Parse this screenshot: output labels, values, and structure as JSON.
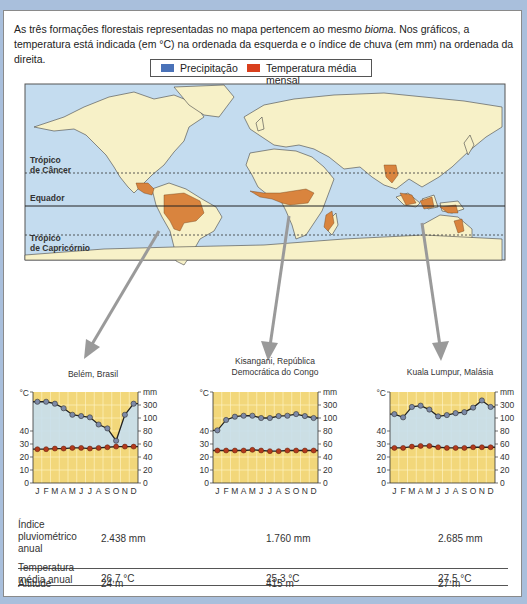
{
  "intro": {
    "part1": "As três formações florestais representadas no mapa pertencem ao mesmo ",
    "italic": "bioma",
    "part2": ". Nos gráficos, a temperatura está indicada (em °C) na ordenada da esquerda e o índice de chuva (em mm) na ordenada da direita."
  },
  "legend": {
    "precip_label": "Precipitação",
    "precip_color": "#4a72b8",
    "temp_label": "Temperatura média mensal",
    "temp_color": "#d9401e"
  },
  "map": {
    "labels": {
      "cancer_line1": "Trópico",
      "cancer_line2": "de Câncer",
      "equator": "Equador",
      "capricorn_line1": "Trópico",
      "capricorn_line2": "de Capricórnio"
    },
    "colors": {
      "ocean": "#c4dcef",
      "land": "#f7f1c8",
      "forest": "#d9843e"
    }
  },
  "chart_data": [
    {
      "type": "line",
      "title": "Belém, Brasil",
      "categories": [
        "J",
        "F",
        "M",
        "A",
        "M",
        "J",
        "J",
        "A",
        "S",
        "O",
        "N",
        "D"
      ],
      "xlabel": "mês",
      "ylabel_left": "°C",
      "ylabel_right": "mm",
      "left_ticks": [
        "0",
        "10",
        "20",
        "30",
        "40"
      ],
      "right_ticks": [
        "0",
        "20",
        "40",
        "60",
        "80",
        "100",
        "300"
      ],
      "series": [
        {
          "name": "Precipitação",
          "unit": "mm",
          "values": [
            350,
            350,
            320,
            250,
            150,
            130,
            110,
            90,
            84,
            65,
            150,
            320
          ]
        },
        {
          "name": "Temperatura média mensal",
          "unit": "°C",
          "values": [
            26,
            26,
            26.5,
            26.5,
            27,
            27,
            26.5,
            27,
            27.5,
            28,
            28,
            28
          ]
        }
      ]
    },
    {
      "type": "line",
      "title": "Kisangani, República Democrática do Congo",
      "title_line1": "Kisangani, República",
      "title_line2": "Democrática do Congo",
      "categories": [
        "J",
        "F",
        "M",
        "A",
        "M",
        "J",
        "J",
        "A",
        "S",
        "O",
        "N",
        "D"
      ],
      "xlabel": "mês",
      "ylabel_left": "°C",
      "ylabel_right": "mm",
      "left_ticks": [
        "0",
        "10",
        "20",
        "30",
        "40"
      ],
      "right_ticks": [
        "0",
        "20",
        "40",
        "60",
        "80",
        "100",
        "300"
      ],
      "series": [
        {
          "name": "Precipitação",
          "unit": "mm",
          "values": [
            81,
            97,
            120,
            135,
            135,
            100,
            100,
            130,
            135,
            160,
            130,
            100
          ]
        },
        {
          "name": "Temperatura média mensal",
          "unit": "°C",
          "values": [
            25,
            25,
            25,
            25,
            25.5,
            25,
            24.5,
            24.5,
            25,
            25,
            25,
            25
          ]
        }
      ]
    },
    {
      "type": "line",
      "title": "Kuala Lumpur, Malásia",
      "categories": [
        "J",
        "F",
        "M",
        "A",
        "M",
        "J",
        "J",
        "A",
        "S",
        "O",
        "N",
        "D"
      ],
      "xlabel": "mês",
      "ylabel_left": "°C",
      "ylabel_right": "mm",
      "left_ticks": [
        "0",
        "10",
        "20",
        "30",
        "40"
      ],
      "right_ticks": [
        "0",
        "20",
        "40",
        "60",
        "80",
        "100",
        "300"
      ],
      "series": [
        {
          "name": "Precipitação",
          "unit": "mm",
          "values": [
            160,
            110,
            270,
            290,
            230,
            125,
            145,
            175,
            190,
            260,
            370,
            270
          ]
        },
        {
          "name": "Temperatura média mensal",
          "unit": "°C",
          "values": [
            27,
            27,
            28,
            28.5,
            28.5,
            27.5,
            27,
            27,
            27,
            27.5,
            27.5,
            27.5
          ]
        }
      ]
    }
  ],
  "charts_text": {
    "belem_title": "Belém, Brasil",
    "kisangani_title1": "Kisangani, República",
    "kisangani_title2": "Democrática do Congo",
    "kuala_title": "Kuala Lumpur, Malásia",
    "xlabel": "mês"
  },
  "table": {
    "rows": [
      {
        "header_lines": [
          "Índice",
          "pluviométrico",
          "anual"
        ],
        "values": [
          "2.438 mm",
          "1.760 mm",
          "2.685 mm"
        ]
      },
      {
        "header_lines": [
          "Temperatura",
          "média anual"
        ],
        "values": [
          "26,7 °C",
          "25,3 °C",
          "27,5 °C"
        ]
      },
      {
        "header_lines": [
          "Altitude"
        ],
        "values": [
          "24 m",
          "415 m",
          "27 m"
        ]
      }
    ]
  }
}
